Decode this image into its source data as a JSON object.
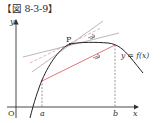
{
  "figure": {
    "title": "【図 8-3-9】",
    "labels": {
      "y_axis": "y",
      "x_axis": "x",
      "origin": "O",
      "point": "P",
      "a": "a",
      "b": "b",
      "function": "y = f(x)"
    },
    "colors": {
      "curve": "#222222",
      "secant": "#e0505a",
      "tangent": "#999999",
      "dashed": "#e88890",
      "axis": "#333333"
    }
  }
}
